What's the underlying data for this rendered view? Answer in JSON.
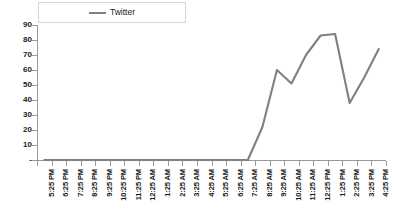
{
  "chart_data": {
    "type": "line",
    "title": "",
    "xlabel": "",
    "ylabel": "",
    "ylim": [
      0,
      90
    ],
    "ytick_step": 10,
    "grid": false,
    "legend_position": "top-center",
    "line_color": "#808080",
    "categories": [
      "5:25 PM",
      "6:25 PM",
      "7:25 PM",
      "8:25 PM",
      "9:25 PM",
      "10:25 PM",
      "11:25 PM",
      "12:25 AM",
      "1:25 AM",
      "2:25 AM",
      "3:25 AM",
      "4:25 AM",
      "5:25 AM",
      "6:25 AM",
      "7:25 AM",
      "8:25 AM",
      "9:25 AM",
      "10:25 AM",
      "11:25 AM",
      "12:25 PM",
      "1:25 PM",
      "2:25 PM",
      "3:25 PM",
      "4:25 PM"
    ],
    "ytick_labels": [
      "90",
      "80",
      "70",
      "60",
      "50",
      "40",
      "30",
      "20",
      "10",
      "-"
    ],
    "ytick_values": [
      90,
      80,
      70,
      60,
      50,
      40,
      30,
      20,
      10,
      0
    ],
    "series": [
      {
        "name": "Twitter",
        "values": [
          0,
          0,
          0,
          0,
          0,
          0,
          0,
          0,
          0,
          0,
          0,
          0,
          0,
          0,
          0,
          22,
          60,
          51,
          70,
          83,
          84,
          38,
          55,
          74
        ]
      }
    ]
  },
  "legend": {
    "entries": [
      {
        "label": "Twitter",
        "color": "#808080"
      }
    ]
  }
}
